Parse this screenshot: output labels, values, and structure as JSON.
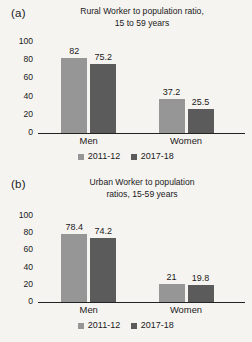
{
  "figure": {
    "background_color": "#f6f4f1",
    "panels": [
      {
        "letter": "(a)",
        "chart_data": {
          "type": "bar",
          "title": "Rural Worker to population ratio, 15 to 59 years",
          "title_line1": "Rural Worker to population ratio,",
          "title_line2": "15 to 59 years",
          "xlabel": "",
          "ylabel": "",
          "ylim": [
            0,
            100
          ],
          "yticks": [
            100,
            80,
            60,
            40,
            20,
            0
          ],
          "grid": false,
          "legend_position": "bottom",
          "categories": [
            "Men",
            "Women"
          ],
          "series": [
            {
              "name": "2011-12",
              "color": "#969696",
              "values": [
                82,
                37.2
              ],
              "labels": [
                "82",
                "37.2"
              ]
            },
            {
              "name": "2017-18",
              "color": "#5b5b5b",
              "values": [
                75.2,
                25.5
              ],
              "labels": [
                "75.2",
                "25.5"
              ]
            }
          ]
        }
      },
      {
        "letter": "(b)",
        "chart_data": {
          "type": "bar",
          "title": "Urban Worker to population ratios, 15-59 years",
          "title_line1": "Urban Worker to population",
          "title_line2": "ratios, 15-59 years",
          "xlabel": "",
          "ylabel": "",
          "ylim": [
            0,
            100
          ],
          "yticks": [
            100,
            80,
            60,
            40,
            20,
            0
          ],
          "grid": false,
          "legend_position": "bottom",
          "categories": [
            "Men",
            "Women"
          ],
          "series": [
            {
              "name": "2011-12",
              "color": "#969696",
              "values": [
                78.4,
                21
              ],
              "labels": [
                "78.4",
                "21"
              ]
            },
            {
              "name": "2017-18",
              "color": "#5b5b5b",
              "values": [
                74.2,
                19.8
              ],
              "labels": [
                "74.2",
                "19.8"
              ]
            }
          ]
        }
      }
    ]
  },
  "chart_data": [
    {
      "type": "bar",
      "title": "Rural Worker to population ratio, 15 to 59 years",
      "categories": [
        "Men",
        "Women"
      ],
      "series": [
        {
          "name": "2011-12",
          "values": [
            82,
            37.2
          ]
        },
        {
          "name": "2017-18",
          "values": [
            75.2,
            25.5
          ]
        }
      ],
      "xlabel": "",
      "ylabel": "",
      "ylim": [
        0,
        100
      ],
      "yticks": [
        100,
        80,
        60,
        40,
        20,
        0
      ],
      "grid": false,
      "legend_position": "bottom"
    },
    {
      "type": "bar",
      "title": "Urban Worker to population ratios, 15-59 years",
      "categories": [
        "Men",
        "Women"
      ],
      "series": [
        {
          "name": "2011-12",
          "values": [
            78.4,
            21
          ]
        },
        {
          "name": "2017-18",
          "values": [
            74.2,
            19.8
          ]
        }
      ],
      "xlabel": "",
      "ylabel": "",
      "ylim": [
        0,
        100
      ],
      "yticks": [
        100,
        80,
        60,
        40,
        20,
        0
      ],
      "grid": false,
      "legend_position": "bottom"
    }
  ]
}
